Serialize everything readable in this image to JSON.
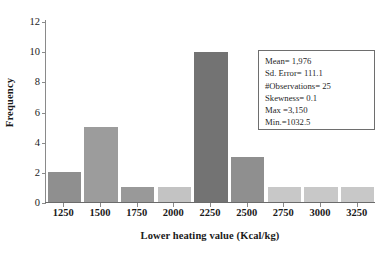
{
  "chart_data": {
    "type": "bar",
    "title": "",
    "xlabel": "Lower heating value (Kcal/kg)",
    "ylabel": "Frequency",
    "categories": [
      "1250",
      "1500",
      "1750",
      "2000",
      "2250",
      "2500",
      "2750",
      "3000",
      "3250"
    ],
    "values": [
      2,
      5,
      1,
      1,
      10,
      3,
      1,
      1,
      1
    ],
    "bar_colors": [
      "#8f8f8f",
      "#9c9c9c",
      "#999999",
      "#c3c3c3",
      "#737373",
      "#8f8f8f",
      "#c8c8c8",
      "#c8c8c8",
      "#c8c8c8"
    ],
    "ylim": [
      0,
      12
    ],
    "yticks": [
      0,
      2,
      4,
      6,
      8,
      10,
      12
    ],
    "grid": false,
    "legend": false
  },
  "stats_box": {
    "lines": [
      "Mean= 1,976",
      "Sd. Error= 111.1",
      "#Observations= 25",
      "Skewness= 0.1",
      "Max =3,150",
      "Min.=1032.5"
    ]
  }
}
